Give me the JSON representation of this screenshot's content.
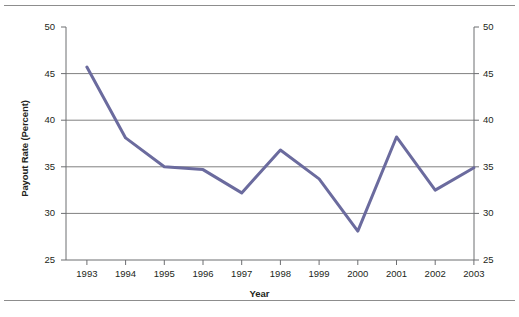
{
  "figure": {
    "background_color": "#ffffff",
    "rule_color": "#8d8d8d",
    "axis_color": "#6d6e71",
    "grid_color": "#808080",
    "line_color": "#6b6b9e"
  },
  "chart_data": {
    "type": "line",
    "title": "",
    "xlabel": "Year",
    "ylabel": "Payout Rate (Percent)",
    "xlim": [
      1993,
      2003
    ],
    "ylim": [
      25,
      50
    ],
    "grid": true,
    "legend": "none",
    "y_axes": [
      "left",
      "right"
    ],
    "categories": [
      "1993",
      "1994",
      "1995",
      "1996",
      "1997",
      "1998",
      "1999",
      "2000",
      "2001",
      "2002",
      "2003"
    ],
    "x": [
      1993,
      1994,
      1995,
      1996,
      1997,
      1998,
      1999,
      2000,
      2001,
      2002,
      2003
    ],
    "values": [
      45.7,
      38.1,
      35.0,
      34.7,
      32.2,
      36.8,
      33.7,
      28.1,
      38.2,
      32.5,
      34.9
    ],
    "series": [
      {
        "name": "Payout Rate",
        "color": "#6b6b9e",
        "values": [
          45.7,
          38.1,
          35.0,
          34.7,
          32.2,
          36.8,
          33.7,
          28.1,
          38.2,
          32.5,
          34.9
        ]
      }
    ],
    "yticks": [
      25,
      30,
      35,
      40,
      45,
      50
    ],
    "ytick_labels_left": [
      "25",
      "30",
      "35",
      "40",
      "45",
      "50"
    ],
    "ytick_labels_right": [
      "25",
      "30",
      "35",
      "40",
      "45",
      "50"
    ],
    "xtick_labels": [
      "1993",
      "1994",
      "1995",
      "1996",
      "1997",
      "1998",
      "1999",
      "2000",
      "2001",
      "2002",
      "2003"
    ]
  },
  "axis": {
    "left_labels": [
      "50",
      "45",
      "40",
      "35",
      "30",
      "25"
    ],
    "right_labels": [
      "50",
      "45",
      "40",
      "35",
      "30",
      "25"
    ],
    "x_labels": [
      "1993",
      "1994",
      "1995",
      "1996",
      "1997",
      "1998",
      "1999",
      "2000",
      "2001",
      "2002",
      "2003"
    ],
    "y_title": "Payout Rate (Percent)",
    "x_title": "Year"
  }
}
